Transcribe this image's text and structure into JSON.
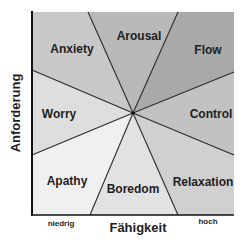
{
  "diagram": {
    "type": "flow-model-octants",
    "y_axis_label": "Anforderung",
    "x_axis_label": "Fähigkeit",
    "x_tick_low": "niedrig",
    "x_tick_high": "hoch",
    "regions": [
      {
        "name": "Anxiety",
        "color": "#c8c8c8"
      },
      {
        "name": "Arousal",
        "color": "#b9b9b9"
      },
      {
        "name": "Flow",
        "color": "#a9a9a9"
      },
      {
        "name": "Control",
        "color": "#c2c2c2"
      },
      {
        "name": "Relaxation",
        "color": "#d0d0d0"
      },
      {
        "name": "Boredom",
        "color": "#e2e2e2"
      },
      {
        "name": "Apathy",
        "color": "#f0f0f0"
      },
      {
        "name": "Worry",
        "color": "#dedede"
      }
    ]
  }
}
